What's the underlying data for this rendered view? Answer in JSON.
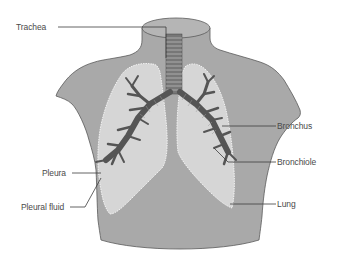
{
  "diagram": {
    "colors": {
      "background": "#ffffff",
      "torso_fill": "#a9a9a9",
      "torso_outline": "#5a5a5a",
      "lung_fill": "#d6d6d6",
      "pleura_outline": "#ffffff",
      "airway": "#555555",
      "label_text": "#4a4a4a",
      "leader_line": "#3c3c3c"
    },
    "labels": [
      {
        "id": "trachea",
        "text": "Trachea",
        "side": "left"
      },
      {
        "id": "bronchus",
        "text": "Bronchus",
        "side": "right"
      },
      {
        "id": "bronchiole",
        "text": "Bronchiole",
        "side": "right"
      },
      {
        "id": "pleura",
        "text": "Pleura",
        "side": "left"
      },
      {
        "id": "pleural_fluid",
        "text": "Pleural fluid",
        "side": "left"
      },
      {
        "id": "lung",
        "text": "Lung",
        "side": "right"
      }
    ]
  }
}
